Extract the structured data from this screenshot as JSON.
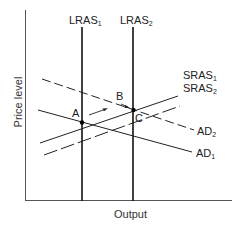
{
  "diagram": {
    "type": "AD-AS macroeconomic model",
    "axes": {
      "x_label": "Output",
      "y_label": "Price level"
    },
    "curves": [
      {
        "id": "LRAS1",
        "name": "LRAS",
        "sub": "1",
        "style": "solid",
        "orientation": "vertical"
      },
      {
        "id": "LRAS2",
        "name": "LRAS",
        "sub": "2",
        "style": "solid",
        "orientation": "vertical"
      },
      {
        "id": "SRAS1",
        "name": "SRAS",
        "sub": "1",
        "style": "solid",
        "orientation": "upward-sloping"
      },
      {
        "id": "SRAS2",
        "name": "SRAS",
        "sub": "2",
        "style": "dashed",
        "orientation": "upward-sloping"
      },
      {
        "id": "AD1",
        "name": "AD",
        "sub": "1",
        "style": "solid",
        "orientation": "downward-sloping"
      },
      {
        "id": "AD2",
        "name": "AD",
        "sub": "2",
        "style": "dashed",
        "orientation": "downward-sloping"
      }
    ],
    "points": [
      {
        "label": "A",
        "description": "LRAS1 ∩ SRAS1 ∩ AD1"
      },
      {
        "label": "B",
        "description": "SRAS1 ∩ AD2"
      },
      {
        "label": "C",
        "description": "LRAS2 ∩ SRAS2 ∩ AD2"
      }
    ],
    "arrows": [
      {
        "from": "A",
        "to": "B"
      },
      {
        "from": "B",
        "to": "C"
      }
    ],
    "labels": {
      "lras1": "LRAS",
      "lras1_sub": "1",
      "lras2": "LRAS",
      "lras2_sub": "2",
      "sras1": "SRAS",
      "sras1_sub": "1",
      "sras2": "SRAS",
      "sras2_sub": "2",
      "ad1": "AD",
      "ad1_sub": "1",
      "ad2": "AD",
      "ad2_sub": "2",
      "point_a": "A",
      "point_b": "B",
      "point_c": "C",
      "x_axis": "Output",
      "y_axis": "Price level"
    }
  }
}
